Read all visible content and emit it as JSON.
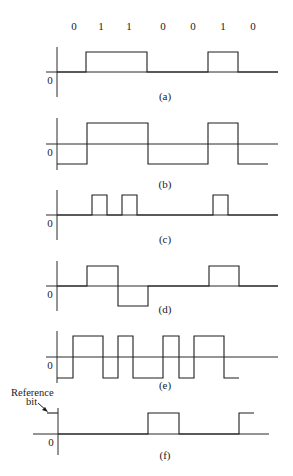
{
  "figure": {
    "bits": [
      "0",
      "1",
      "1",
      "0",
      "0",
      "1",
      "0"
    ],
    "bit_label_x": [
      74,
      101,
      129,
      163,
      193,
      223,
      253
    ],
    "bit_label_y": 30,
    "zero_label": "0",
    "reference_label_line1": "Reference",
    "reference_label_line2": "bit",
    "colors": {
      "line": "#1e1e1e",
      "background": "#ffffff"
    },
    "panels": [
      {
        "id": "a",
        "caption": "(a)",
        "caption_y": 100,
        "axis": {
          "x": 57,
          "y_top": 47,
          "y_bottom": 97,
          "baseline_y": 72,
          "x_start": 46,
          "x_end": 278
        },
        "zero_label_pos": [
          50,
          84
        ],
        "points": [
          [
            57,
            72
          ],
          [
            86,
            72
          ],
          [
            86,
            52
          ],
          [
            147,
            52
          ],
          [
            147,
            72
          ],
          [
            208,
            72
          ],
          [
            208,
            52
          ],
          [
            238,
            52
          ],
          [
            238,
            72
          ],
          [
            278,
            72
          ]
        ]
      },
      {
        "id": "b",
        "caption": "(b)",
        "caption_y": 188,
        "axis": {
          "x": 57,
          "y_top": 118,
          "y_bottom": 170,
          "baseline_y": 144,
          "x_start": 46,
          "x_end": 278
        },
        "zero_label_pos": [
          50,
          156
        ],
        "points": [
          [
            57,
            164
          ],
          [
            87,
            164
          ],
          [
            87,
            123
          ],
          [
            148,
            123
          ],
          [
            148,
            164
          ],
          [
            208,
            164
          ],
          [
            208,
            123
          ],
          [
            238,
            123
          ],
          [
            238,
            164
          ],
          [
            268,
            164
          ]
        ]
      },
      {
        "id": "c",
        "caption": "(c)",
        "caption_y": 243,
        "axis": {
          "x": 57,
          "y_top": 190,
          "y_bottom": 240,
          "baseline_y": 215,
          "x_start": 46,
          "x_end": 278
        },
        "zero_label_pos": [
          50,
          227
        ],
        "points": [
          [
            57,
            215
          ],
          [
            92,
            215
          ],
          [
            92,
            195
          ],
          [
            107,
            195
          ],
          [
            107,
            215
          ],
          [
            122,
            215
          ],
          [
            122,
            195
          ],
          [
            137,
            195
          ],
          [
            137,
            215
          ],
          [
            213,
            215
          ],
          [
            213,
            195
          ],
          [
            228,
            195
          ],
          [
            228,
            215
          ],
          [
            278,
            215
          ]
        ]
      },
      {
        "id": "d",
        "caption": "(d)",
        "caption_y": 313,
        "axis": {
          "x": 57,
          "y_top": 261,
          "y_bottom": 311,
          "baseline_y": 286,
          "x_start": 46,
          "x_end": 278
        },
        "zero_label_pos": [
          50,
          298
        ],
        "points": [
          [
            57,
            286
          ],
          [
            87,
            286
          ],
          [
            87,
            266
          ],
          [
            118,
            266
          ],
          [
            118,
            306
          ],
          [
            148,
            306
          ],
          [
            148,
            286
          ],
          [
            209,
            286
          ],
          [
            209,
            266
          ],
          [
            239,
            266
          ],
          [
            239,
            286
          ],
          [
            278,
            286
          ]
        ]
      },
      {
        "id": "e",
        "caption": "(e)",
        "caption_y": 389,
        "axis": {
          "x": 57,
          "y_top": 331,
          "y_bottom": 383,
          "baseline_y": 357,
          "x_start": 46,
          "x_end": 278
        },
        "zero_label_pos": [
          50,
          369
        ],
        "points": [
          [
            57,
            378
          ],
          [
            73,
            378
          ],
          [
            73,
            336
          ],
          [
            103,
            336
          ],
          [
            103,
            378
          ],
          [
            118,
            378
          ],
          [
            118,
            336
          ],
          [
            133,
            336
          ],
          [
            133,
            378
          ],
          [
            163,
            378
          ],
          [
            163,
            336
          ],
          [
            179,
            336
          ],
          [
            179,
            378
          ],
          [
            194,
            378
          ],
          [
            194,
            336
          ],
          [
            224,
            336
          ],
          [
            224,
            378
          ],
          [
            239,
            378
          ]
        ]
      },
      {
        "id": "f",
        "caption": "(f)",
        "caption_y": 459,
        "axis": {
          "x": 58,
          "y_top": 408,
          "y_bottom": 455,
          "baseline_y": 434,
          "x_start": 33,
          "x_end": 269
        },
        "zero_label_pos": [
          51,
          446
        ],
        "points": [
          [
            47,
            413
          ],
          [
            58,
            413
          ]
        ],
        "points2": [
          [
            58,
            434
          ],
          [
            148,
            434
          ],
          [
            148,
            413
          ],
          [
            179,
            413
          ],
          [
            179,
            434
          ],
          [
            239,
            434
          ],
          [
            239,
            413
          ],
          [
            254,
            413
          ]
        ]
      }
    ]
  }
}
